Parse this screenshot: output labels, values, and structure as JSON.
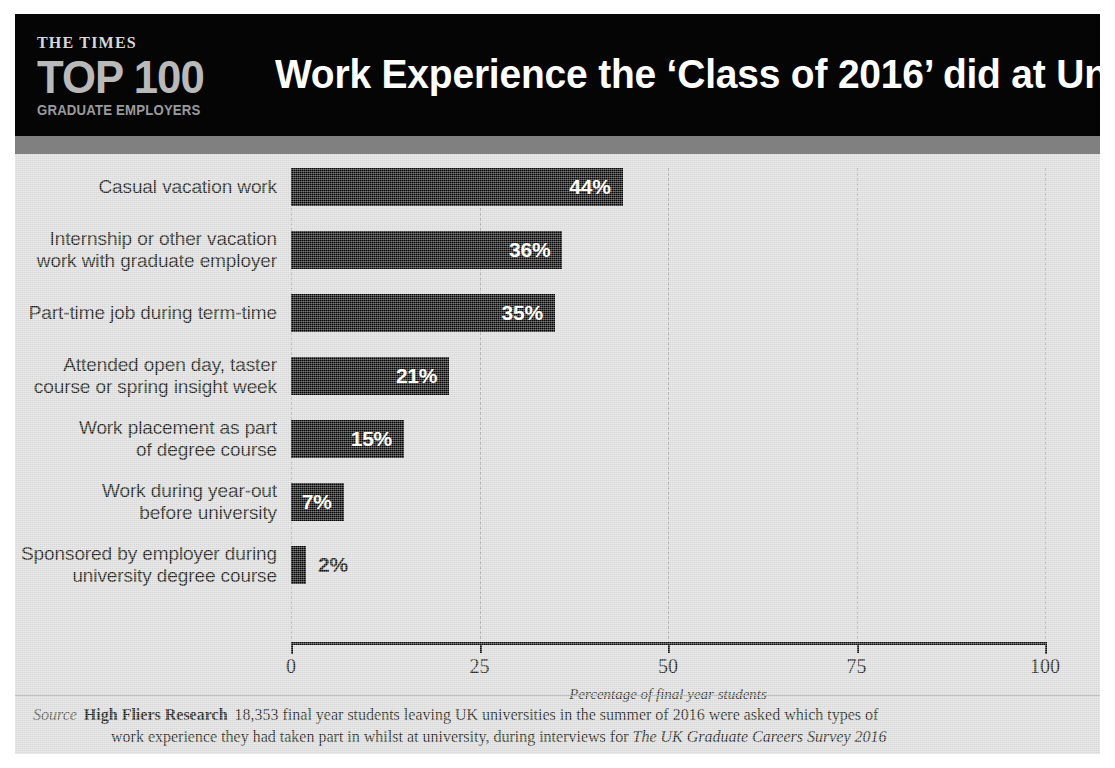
{
  "header": {
    "logo_times": "THE TIMES",
    "logo_crest": "times-crest-icon",
    "logo_top100": "TOP 100",
    "logo_subtitle": "GRADUATE EMPLOYERS",
    "title": "Work Experience the ‘Class of 2016’ did at University"
  },
  "chart_data": {
    "type": "bar",
    "orientation": "horizontal",
    "title": "Work Experience the ‘Class of 2016’ did at University",
    "categories": [
      "Casual vacation work",
      "Internship or other vacation\nwork with graduate employer",
      "Part-time job during term-time",
      "Attended open day, taster\ncourse or spring insight week",
      "Work placement as part\nof degree course",
      "Work during year-out\nbefore university",
      "Sponsored by employer during\nuniversity degree course"
    ],
    "values": [
      44,
      36,
      35,
      21,
      15,
      7,
      2
    ],
    "value_labels": [
      "44%",
      "36%",
      "35%",
      "21%",
      "15%",
      "7%",
      "2%"
    ],
    "label_inside": [
      true,
      true,
      true,
      true,
      true,
      true,
      false
    ],
    "xlabel": "Percentage of final year students",
    "ylabel": "",
    "xlim": [
      0,
      100
    ],
    "xticks": [
      0,
      25,
      50,
      75,
      100
    ],
    "xticklabels": [
      "0",
      "25",
      "50",
      "75",
      "100"
    ],
    "grid": "vertical-dashed",
    "legend": "none",
    "bar_color": "#050505",
    "background_color": "#d9d9d9"
  },
  "source": {
    "label": "Source",
    "organisation": "High Fliers Research",
    "line1_rest": "18,353 final year students leaving UK universities in the summer of 2016 were asked which types of",
    "line2_pre": "work experience they had taken part in whilst at university, during interviews for ",
    "line2_italic": "The UK Graduate Careers Survey 2016"
  },
  "colors": {
    "header_bg": "#050505",
    "sub_band": "#808080",
    "panel_bg": "#d9d9d9",
    "bar": "#050505",
    "gridline": "#a8a8a8",
    "axis": "#111111"
  }
}
